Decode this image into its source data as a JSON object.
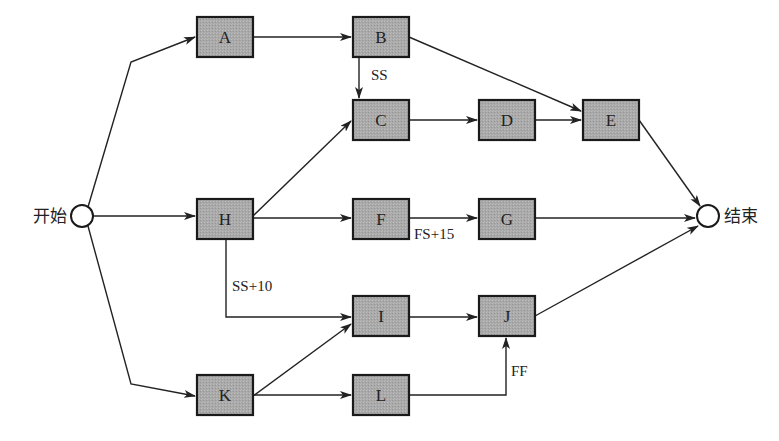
{
  "diagram": {
    "type": "precedence-network",
    "colors": {
      "box_fill": "#a8a8a8",
      "box_stroke": "#1a1a1a",
      "line": "#222222",
      "background": "#ffffff"
    },
    "start": {
      "id": "start",
      "label": "开始",
      "x": 82,
      "y": 216,
      "r": 11
    },
    "end": {
      "id": "end",
      "label": "结束",
      "x": 708,
      "y": 216,
      "r": 11
    },
    "nodes": [
      {
        "id": "A",
        "label": "A",
        "x": 197,
        "y": 17,
        "w": 56,
        "h": 40
      },
      {
        "id": "B",
        "label": "B",
        "x": 353,
        "y": 17,
        "w": 56,
        "h": 40
      },
      {
        "id": "C",
        "label": "C",
        "x": 353,
        "y": 100,
        "w": 56,
        "h": 40
      },
      {
        "id": "D",
        "label": "D",
        "x": 479,
        "y": 100,
        "w": 56,
        "h": 40
      },
      {
        "id": "E",
        "label": "E",
        "x": 583,
        "y": 100,
        "w": 56,
        "h": 40
      },
      {
        "id": "H",
        "label": "H",
        "x": 197,
        "y": 199,
        "w": 56,
        "h": 40
      },
      {
        "id": "F",
        "label": "F",
        "x": 353,
        "y": 199,
        "w": 56,
        "h": 40
      },
      {
        "id": "G",
        "label": "G",
        "x": 479,
        "y": 199,
        "w": 56,
        "h": 40
      },
      {
        "id": "I",
        "label": "I",
        "x": 353,
        "y": 296,
        "w": 56,
        "h": 40
      },
      {
        "id": "J",
        "label": "J",
        "x": 479,
        "y": 296,
        "w": 56,
        "h": 40
      },
      {
        "id": "K",
        "label": "K",
        "x": 197,
        "y": 375,
        "w": 56,
        "h": 40
      },
      {
        "id": "L",
        "label": "L",
        "x": 353,
        "y": 375,
        "w": 56,
        "h": 40
      }
    ],
    "edges": [
      {
        "from": "start",
        "to": "A",
        "points": [
          [
            88,
            207
          ],
          [
            131,
            62
          ],
          [
            195,
            37
          ]
        ]
      },
      {
        "from": "start",
        "to": "H",
        "points": [
          [
            93,
            216
          ],
          [
            195,
            216
          ]
        ]
      },
      {
        "from": "start",
        "to": "K",
        "points": [
          [
            88,
            226
          ],
          [
            131,
            384
          ],
          [
            195,
            396
          ]
        ]
      },
      {
        "from": "A",
        "to": "B",
        "points": [
          [
            253,
            37
          ],
          [
            351,
            37
          ]
        ]
      },
      {
        "from": "B",
        "to": "C",
        "label": "SS",
        "label_x": 371,
        "label_y": 80,
        "points": [
          [
            359,
            57
          ],
          [
            359,
            98
          ]
        ]
      },
      {
        "from": "B",
        "to": "E",
        "points": [
          [
            409,
            37
          ],
          [
            581,
            111
          ]
        ]
      },
      {
        "from": "H",
        "to": "C",
        "points": [
          [
            253,
            216
          ],
          [
            351,
            121
          ]
        ]
      },
      {
        "from": "H",
        "to": "F",
        "points": [
          [
            253,
            218
          ],
          [
            351,
            218
          ]
        ]
      },
      {
        "from": "H",
        "to": "I",
        "label": "SS+10",
        "label_x": 232,
        "label_y": 291,
        "points": [
          [
            226,
            239
          ],
          [
            226,
            317
          ],
          [
            351,
            317
          ]
        ]
      },
      {
        "from": "C",
        "to": "D",
        "points": [
          [
            409,
            120
          ],
          [
            477,
            120
          ]
        ]
      },
      {
        "from": "D",
        "to": "E",
        "points": [
          [
            535,
            120
          ],
          [
            581,
            120
          ]
        ]
      },
      {
        "from": "F",
        "to": "G",
        "label": "FS+15",
        "label_x": 414,
        "label_y": 239,
        "points": [
          [
            409,
            218
          ],
          [
            477,
            218
          ]
        ]
      },
      {
        "from": "G",
        "to": "end",
        "points": [
          [
            535,
            218
          ],
          [
            695,
            218
          ]
        ]
      },
      {
        "from": "E",
        "to": "end",
        "points": [
          [
            639,
            120
          ],
          [
            700,
            206
          ]
        ]
      },
      {
        "from": "K",
        "to": "I",
        "points": [
          [
            253,
            396
          ],
          [
            351,
            324
          ]
        ]
      },
      {
        "from": "K",
        "to": "L",
        "points": [
          [
            253,
            395
          ],
          [
            351,
            395
          ]
        ]
      },
      {
        "from": "I",
        "to": "J",
        "points": [
          [
            409,
            317
          ],
          [
            477,
            317
          ]
        ]
      },
      {
        "from": "L",
        "to": "J",
        "label": "FF",
        "label_x": 511,
        "label_y": 376,
        "points": [
          [
            409,
            395
          ],
          [
            506,
            395
          ],
          [
            506,
            338
          ]
        ]
      },
      {
        "from": "J",
        "to": "end",
        "points": [
          [
            535,
            316
          ],
          [
            698,
            226
          ]
        ]
      }
    ]
  }
}
